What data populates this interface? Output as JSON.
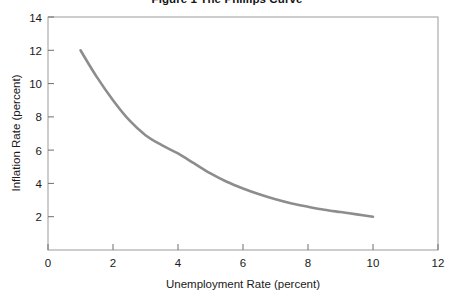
{
  "chart_data": {
    "type": "line",
    "title": "Figure 1  The Phillips Curve",
    "xlabel": "Unemployment Rate (percent)",
    "ylabel": "Inflation Rate (percent)",
    "xlim": [
      0,
      12
    ],
    "ylim": [
      0,
      14
    ],
    "xticks": [
      "0",
      "2",
      "4",
      "6",
      "8",
      "10",
      "12"
    ],
    "xtick_values": [
      0,
      2,
      4,
      6,
      8,
      10,
      12
    ],
    "yticks": [
      "2",
      "4",
      "6",
      "8",
      "10",
      "12",
      "14"
    ],
    "ytick_values": [
      2,
      4,
      6,
      8,
      10,
      12,
      14
    ],
    "grid": false,
    "legend": "none",
    "series": [
      {
        "name": "Phillips curve",
        "color": "#8d8d8d",
        "line_width": 2.6,
        "x": [
          1.0,
          1.5,
          2.0,
          2.5,
          3.0,
          3.5,
          4.0,
          4.5,
          5.0,
          5.5,
          6.0,
          6.5,
          7.0,
          7.5,
          8.0,
          8.5,
          9.0,
          9.5,
          10.0
        ],
        "values": [
          12.0,
          10.4,
          9.0,
          7.8,
          6.9,
          6.3,
          5.8,
          5.2,
          4.6,
          4.1,
          3.7,
          3.35,
          3.05,
          2.8,
          2.6,
          2.42,
          2.28,
          2.14,
          2.0
        ]
      }
    ]
  },
  "axes": {
    "frame_color": "#9b9b9b",
    "tick_color": "#6e6e6e",
    "background": "#ffffff"
  }
}
